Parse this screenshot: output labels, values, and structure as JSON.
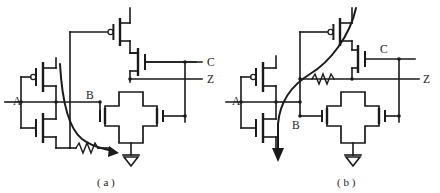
{
  "figure": {
    "title": "",
    "background_color": "#ffffff",
    "line_color": "#1a1a1a",
    "width": 440,
    "height": 193
  },
  "panels": [
    {
      "id": "a",
      "caption": "( a )",
      "caption_x": 108,
      "caption_y": 182,
      "labels": [
        {
          "name": "input-a",
          "text": "A",
          "x": 13,
          "y": 104
        },
        {
          "name": "node-b",
          "text": "B",
          "x": 88,
          "y": 96
        },
        {
          "name": "signal-c",
          "text": "C",
          "x": 208,
          "y": 55
        },
        {
          "name": "output-z",
          "text": "Z",
          "x": 208,
          "y": 74
        }
      ],
      "components": {
        "pmos_inverter": "pmos-transistor",
        "nmos_inverter": "nmos-transistor",
        "pmos_pullup": "pmos-transistor",
        "nmos_c": "nmos-transistor",
        "nmos_b": "nmos-transistor",
        "nmos_z": "nmos-transistor",
        "block": "cross-block",
        "resistor": "resistor-zigzag",
        "ground": "ground-symbol",
        "current_arrow": "current-path-arrow"
      }
    },
    {
      "id": "b",
      "caption": "( b )",
      "caption_x": 348,
      "caption_y": 182,
      "labels": [
        {
          "name": "input-a",
          "text": "A",
          "x": 233,
          "y": 104
        },
        {
          "name": "node-b",
          "text": "B",
          "x": 293,
          "y": 126
        },
        {
          "name": "signal-c",
          "text": "C",
          "x": 382,
          "y": 50
        },
        {
          "name": "output-z",
          "text": "Z",
          "x": 424,
          "y": 78
        }
      ],
      "components": {
        "pmos_inverter": "pmos-transistor",
        "nmos_inverter": "nmos-transistor",
        "pmos_pullup": "pmos-transistor",
        "nmos_c": "nmos-transistor",
        "nmos_b": "nmos-transistor",
        "nmos_z": "nmos-transistor",
        "block": "cross-block",
        "resistor": "resistor-zigzag",
        "ground": "ground-symbol",
        "current_arrow": "current-path-arrow"
      }
    }
  ]
}
